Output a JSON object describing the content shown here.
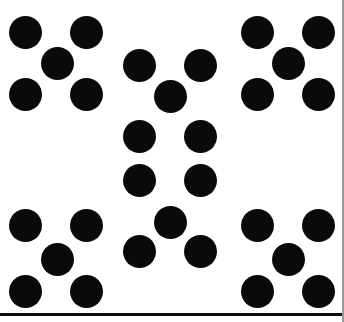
{
  "figure": {
    "title": "Dot pattern array",
    "width": 344,
    "height": 322,
    "background_color": "#ffffff",
    "dot_color": "#0a0a0a",
    "dot_diameter": 33,
    "total_dots": 30,
    "group_count": 6,
    "dots_per_group": 5
  },
  "rules": {
    "bottom_rule": {
      "y": 313,
      "height": 3,
      "color": "#0d0d0d"
    },
    "right_rule": {
      "x": 342,
      "width": 2,
      "height": 322,
      "color": "#9a9a9a"
    }
  },
  "chart_data": {
    "type": "scatter",
    "title": "Dot pattern array",
    "xlabel": "",
    "ylabel": "",
    "xlim": [
      0,
      344
    ],
    "ylim": [
      0,
      322
    ],
    "grid": false,
    "legend": null,
    "marker": "filled-circle",
    "marker_color": "#0a0a0a",
    "marker_diameter": 33,
    "groups": [
      {
        "name": "top-left-quincunx",
        "count": 5,
        "points": [
          {
            "x": 25,
            "y": 32
          },
          {
            "x": 86,
            "y": 32
          },
          {
            "x": 57,
            "y": 63
          },
          {
            "x": 25,
            "y": 94
          },
          {
            "x": 86,
            "y": 94
          }
        ]
      },
      {
        "name": "top-center-quincunx",
        "count": 5,
        "points": [
          {
            "x": 139,
            "y": 65
          },
          {
            "x": 200,
            "y": 65
          },
          {
            "x": 170,
            "y": 96
          },
          {
            "x": 139,
            "y": 136
          },
          {
            "x": 200,
            "y": 136
          }
        ]
      },
      {
        "name": "top-right-quincunx",
        "count": 5,
        "points": [
          {
            "x": 257,
            "y": 32
          },
          {
            "x": 318,
            "y": 32
          },
          {
            "x": 288,
            "y": 63
          },
          {
            "x": 257,
            "y": 94
          },
          {
            "x": 318,
            "y": 94
          }
        ]
      },
      {
        "name": "bottom-center-quincunx",
        "count": 5,
        "points": [
          {
            "x": 139,
            "y": 180
          },
          {
            "x": 200,
            "y": 180
          },
          {
            "x": 170,
            "y": 222
          },
          {
            "x": 139,
            "y": 251
          },
          {
            "x": 200,
            "y": 251
          }
        ]
      },
      {
        "name": "bottom-left-quincunx",
        "count": 5,
        "points": [
          {
            "x": 25,
            "y": 225
          },
          {
            "x": 86,
            "y": 225
          },
          {
            "x": 57,
            "y": 259
          },
          {
            "x": 25,
            "y": 291
          },
          {
            "x": 86,
            "y": 291
          }
        ]
      },
      {
        "name": "bottom-right-quincunx",
        "count": 5,
        "points": [
          {
            "x": 257,
            "y": 225
          },
          {
            "x": 318,
            "y": 225
          },
          {
            "x": 288,
            "y": 259
          },
          {
            "x": 257,
            "y": 291
          },
          {
            "x": 318,
            "y": 291
          }
        ]
      }
    ]
  }
}
